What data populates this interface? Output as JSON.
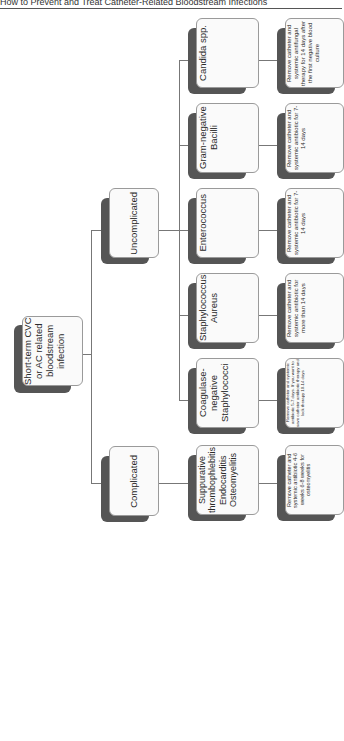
{
  "header": {
    "title": "How to Prevent and Treat Catheter-Related Bloodstream Infections"
  },
  "diagram": {
    "root": {
      "label": "Short-term CVC or AC related bloodstream infection"
    },
    "branches": {
      "complicated": {
        "label": "Complicated",
        "condition": "Suppurative thrombophlebitis Endocarditis Osteomyelitis",
        "treatment": "Remove catheter and systemic antibiotic 4-6 weeks 6-8 weeks for osteomyelitis"
      },
      "uncomplicated": {
        "label": "Uncomplicated",
        "organisms": [
          {
            "label": "Coagulase-negative Staphylococci",
            "treatment": "Remove catheter and systemic antibiotic 5-7 days. If you want to save catheter antibiotic therapy and lock therapy 10-14 days"
          },
          {
            "label": "Staphylococcus Aureus",
            "treatment": "Remove catheter and systemic antibiotic for more than 14 days"
          },
          {
            "label": "Enterococcus",
            "treatment": "Remove catheter and systemic antibiotic for 7-14 days"
          },
          {
            "label": "Gram-negative Bacilli",
            "treatment": "Remove catheter and systemic antibiotic for 7-14 days"
          },
          {
            "label": "Candida spp.",
            "treatment": "Remove catheter and systemic antifungal therapy for 14 days after the first negative blood culture"
          }
        ]
      }
    }
  }
}
